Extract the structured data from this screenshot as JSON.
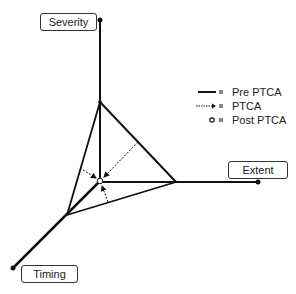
{
  "diagram": {
    "axes": [
      {
        "name": "Severity",
        "label": "Severity"
      },
      {
        "name": "Extent",
        "label": "Extent"
      },
      {
        "name": "Timing",
        "label": "Timing"
      }
    ],
    "legend": [
      {
        "symbol": "solid-line",
        "eq": "=",
        "label": "Pre PTCA"
      },
      {
        "symbol": "dotted-arrow",
        "eq": "=",
        "label": "PTCA"
      },
      {
        "symbol": "open-circle",
        "eq": "=",
        "label": "Post PTCA"
      }
    ],
    "colors": {
      "line": "#111111",
      "background": "#ffffff"
    }
  }
}
